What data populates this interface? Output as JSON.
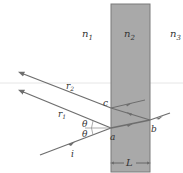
{
  "diagram": {
    "regions": [
      {
        "label": "n",
        "sub": "1"
      },
      {
        "label": "n",
        "sub": "2"
      },
      {
        "label": "n",
        "sub": "3"
      }
    ],
    "rays": {
      "incident": "i",
      "reflected1": "r",
      "reflected1_sub": "1",
      "reflected2": "r",
      "reflected2_sub": "2"
    },
    "points": {
      "a": "a",
      "b": "b",
      "c": "c"
    },
    "angles": {
      "upper": "θ",
      "lower": "θ"
    },
    "thickness": "L",
    "colors": {
      "slab": "#a9a9a9",
      "slab_edge": "#7a7a7a",
      "ray": "#6e6e6e",
      "text": "#333333"
    }
  }
}
